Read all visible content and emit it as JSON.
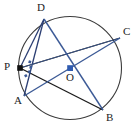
{
  "figure": {
    "type": "circle-geometry-diagram",
    "width": 137,
    "height": 134,
    "background_color": "#ffffff"
  },
  "colors": {
    "circle_stroke": "#3b3b3b",
    "black_chord": "#1a1a1a",
    "blue_chord": "#3c5a96",
    "navy_chord": "#2c3f73",
    "point_fill": "#111111",
    "center_fill": "#2f5bb0",
    "label_color": "#1c1c1c"
  },
  "circle": {
    "name": "main-circle",
    "cx": 70,
    "cy": 68,
    "r": 51.5,
    "stroke_width": 1.1
  },
  "points": [
    {
      "id": "D",
      "label": "D",
      "x": 44,
      "y": 19,
      "label_x": 37,
      "label_y": 2,
      "dot": false
    },
    {
      "id": "C",
      "label": "C",
      "x": 120,
      "y": 38,
      "label_x": 123,
      "label_y": 26,
      "dot": false
    },
    {
      "id": "P",
      "label": "P",
      "x": 20,
      "y": 68,
      "label_x": 4,
      "label_y": 61,
      "dot": true
    },
    {
      "id": "O",
      "label": "O",
      "x": 70,
      "y": 68,
      "label_x": 66,
      "label_y": 73,
      "dot": true
    },
    {
      "id": "A",
      "label": "A",
      "x": 24,
      "y": 96,
      "label_x": 14,
      "label_y": 96,
      "dot": false
    },
    {
      "id": "B",
      "label": "B",
      "x": 103,
      "y": 110,
      "label_x": 106,
      "label_y": 113,
      "dot": false
    }
  ],
  "segments": [
    {
      "name": "segment-P-C",
      "from": "P",
      "to": "C",
      "color_key": "black_chord",
      "width": 1.3
    },
    {
      "name": "segment-P-B",
      "from": "P",
      "to": "B",
      "color_key": "black_chord",
      "width": 1.3
    },
    {
      "name": "segment-D-P",
      "from": "D",
      "to": "P",
      "color_key": "navy_chord",
      "width": 1.3
    },
    {
      "name": "segment-D-A",
      "from": "D",
      "to": "A",
      "color_key": "navy_chord",
      "width": 1.3
    },
    {
      "name": "segment-D-B",
      "from": "D",
      "to": "B",
      "color_key": "blue_chord",
      "width": 1.4
    },
    {
      "name": "segment-A-C",
      "from": "A",
      "to": "C",
      "color_key": "blue_chord",
      "width": 1.4
    },
    {
      "name": "segment-P-O-extended",
      "from": "P",
      "to": "C",
      "color_key": "blue_chord",
      "width": 1.2
    }
  ],
  "center_dot": {
    "name": "center-point-O",
    "x": 70,
    "y": 68,
    "size": 5.5
  },
  "angle_marks": {
    "name": "angle-marks-at-P",
    "vertex_x": 20,
    "vertex_y": 68,
    "count": 4,
    "color_key": "blue_chord"
  }
}
